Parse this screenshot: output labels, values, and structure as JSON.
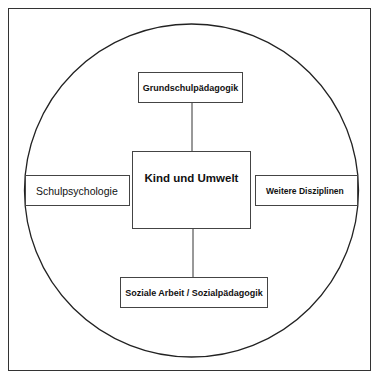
{
  "diagram": {
    "center": {
      "label": "Kind und Umwelt"
    },
    "nodes": {
      "top": {
        "label": "Grundschulpädagogik"
      },
      "left": {
        "label": "Schulpsychologie"
      },
      "right": {
        "label": "Weitere Disziplinen"
      },
      "bottom": {
        "label": "Soziale Arbeit / Sozialpädagogik"
      }
    },
    "colors": {
      "stroke": "#333333",
      "background": "#ffffff",
      "text": "#111111"
    }
  }
}
